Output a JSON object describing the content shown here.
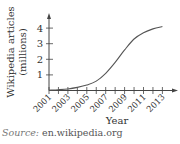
{
  "chart_data": {
    "type": "line",
    "title": "",
    "xlabel": "Year",
    "ylabel": "Wikipedia articles (millions)",
    "ylabel_lines": [
      "Wikipedia articles",
      "(millions)"
    ],
    "x": [
      2001,
      2002,
      2003,
      2004,
      2005,
      2006,
      2007,
      2008,
      2009,
      2010,
      2011,
      2012,
      2013
    ],
    "series": [
      {
        "name": "Wikipedia articles",
        "values": [
          0.02,
          0.05,
          0.1,
          0.2,
          0.35,
          0.6,
          1.1,
          1.8,
          2.6,
          3.3,
          3.7,
          3.95,
          4.1
        ]
      }
    ],
    "xticks": [
      2001,
      2002,
      2003,
      2004,
      2005,
      2006,
      2007,
      2008,
      2009,
      2010,
      2011,
      2012,
      2013
    ],
    "xtick_labels": [
      "2001",
      "2003",
      "2005",
      "2007",
      "2009",
      "2011",
      "2013"
    ],
    "yticks": [
      1,
      2,
      3,
      4
    ],
    "ylim": [
      0,
      4.5
    ],
    "xlim": [
      2001,
      2014
    ],
    "grid": false,
    "legend": "none"
  },
  "source": {
    "label": "Source:",
    "text": "en.wikipedia.org"
  }
}
